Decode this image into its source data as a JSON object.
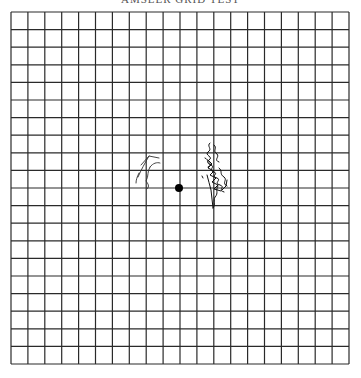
{
  "figure": {
    "caption": "AMSLER GRID TEST",
    "type": "amsler-grid",
    "grid": {
      "columns": 20,
      "rows": 20,
      "left": 11,
      "top": 12,
      "right": 349,
      "bottom": 364,
      "line_color": "#2a2a2a"
    },
    "fixation_dot": {
      "cx": 179,
      "cy": 188,
      "r": 4,
      "color": "#000000"
    },
    "annotations": [
      {
        "name": "left-distortion-mark",
        "description": "patient-drawn wavy line left of center"
      },
      {
        "name": "right-distortion-mark",
        "description": "patient-drawn scribbled distortion right of center"
      }
    ]
  }
}
